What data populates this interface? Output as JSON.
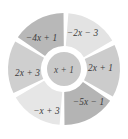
{
  "figure": {
    "type": "sector-wheel-diagram",
    "background_color": "#ffffff",
    "center": {
      "cx": 64,
      "cy": 69
    },
    "outer_radius": 56,
    "inner_radius": 23,
    "hub_radius": 17,
    "gap_degrees": 5,
    "hub": {
      "label": "x + 1",
      "fill": "#c9c9c9",
      "halo_fill": "#ffffff",
      "label_x": 64,
      "label_y": 72.5
    },
    "sectors": [
      {
        "id": "sector-top-right",
        "label": "−2x − 3",
        "fill": "#e3e3e3",
        "start_angle": -88,
        "end_angle": -28,
        "label_x": 82.5,
        "label_y": 35.5,
        "label_rotation": 0,
        "label_anchor": "middle"
      },
      {
        "id": "sector-right",
        "label": "2x + 1",
        "fill": "#cccccc",
        "start_angle": -28,
        "end_angle": 32,
        "label_x": 100.5,
        "label_y": 70.5,
        "label_rotation": 0,
        "label_anchor": "middle"
      },
      {
        "id": "sector-bottom-right",
        "label": "−5x − 1",
        "fill": "#b4b4b4",
        "start_angle": 32,
        "end_angle": 92,
        "label_x": 88.5,
        "label_y": 104.5,
        "label_rotation": 0,
        "label_anchor": "middle"
      },
      {
        "id": "sector-bottom-left",
        "label": "−x + 3",
        "fill": "#e6e6e6",
        "start_angle": 92,
        "end_angle": 152,
        "label_x": 46.5,
        "label_y": 113.5,
        "label_rotation": 0,
        "label_anchor": "middle"
      },
      {
        "id": "sector-left",
        "label": "2x + 3",
        "fill": "#cfcfcf",
        "start_angle": 152,
        "end_angle": 212,
        "label_x": 27.5,
        "label_y": 75.5,
        "label_rotation": 0,
        "label_anchor": "middle"
      },
      {
        "id": "sector-top-left",
        "label": "−4x + 1",
        "fill": "#b8b8b8",
        "start_angle": 212,
        "end_angle": 272,
        "label_x": 41.5,
        "label_y": 40.5,
        "label_rotation": 0,
        "label_anchor": "middle"
      }
    ]
  }
}
